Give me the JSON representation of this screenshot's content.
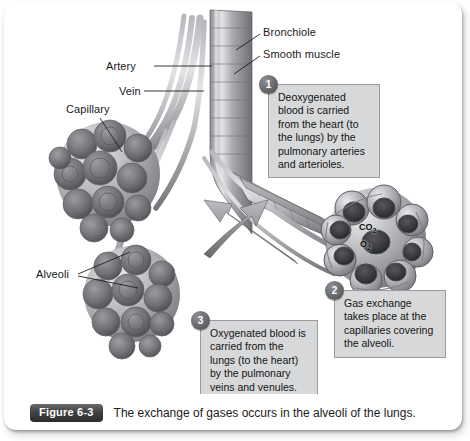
{
  "figure": {
    "badge_label": "Figure 6-3",
    "caption": "The exchange of gases occurs in the alveoli of the lungs."
  },
  "anatomy_labels": [
    {
      "id": "bronchiole",
      "text": "Bronchiole"
    },
    {
      "id": "smooth_muscle",
      "text": "Smooth muscle"
    },
    {
      "id": "artery",
      "text": "Artery"
    },
    {
      "id": "vein",
      "text": "Vein"
    },
    {
      "id": "capillary",
      "text": "Capillary"
    },
    {
      "id": "alveoli",
      "text": "Alveoli"
    }
  ],
  "gas_labels": {
    "carbon_dioxide": "CO",
    "carbon_dioxide_sub": "2",
    "oxygen": "O",
    "oxygen_sub": "2"
  },
  "callouts": [
    {
      "number": "1",
      "text": "Deoxygenated blood is carried from the heart (to the lungs) by the pulmonary arteries and arterioles."
    },
    {
      "number": "2",
      "text": "Gas exchange takes place at the capillaries covering the alveoli."
    },
    {
      "number": "3",
      "text": "Oxygenated blood is carried from the lungs (to the heart) by the pulmonary veins and venules."
    }
  ],
  "colors": {
    "callout_fill": "#d7d8da",
    "callout_border": "#9a9b9e",
    "badge_dark": "#2b2c2e",
    "panel_background": "#ffffff",
    "artwork_tone": "grayscale"
  }
}
